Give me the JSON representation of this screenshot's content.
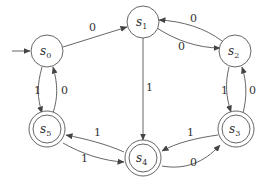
{
  "diagram": {
    "type": "finite-state-automaton",
    "start_state": "s0",
    "states": [
      {
        "id": "s0",
        "label": "s",
        "sub": "0",
        "accepting": false,
        "x": 47,
        "y": 51
      },
      {
        "id": "s1",
        "label": "s",
        "sub": "1",
        "accepting": false,
        "x": 143,
        "y": 22
      },
      {
        "id": "s2",
        "label": "s",
        "sub": "2",
        "accepting": false,
        "x": 235,
        "y": 51
      },
      {
        "id": "s3",
        "label": "s",
        "sub": "3",
        "accepting": true,
        "x": 236,
        "y": 129
      },
      {
        "id": "s4",
        "label": "s",
        "sub": "4",
        "accepting": true,
        "x": 143,
        "y": 158
      },
      {
        "id": "s5",
        "label": "s",
        "sub": "5",
        "accepting": true,
        "x": 47,
        "y": 129
      }
    ],
    "transitions": [
      {
        "from": "s0",
        "to": "s1",
        "label": "0"
      },
      {
        "from": "s0",
        "to": "s5",
        "label": "1"
      },
      {
        "from": "s5",
        "to": "s0",
        "label": "0"
      },
      {
        "from": "s1",
        "to": "s2",
        "label": "0"
      },
      {
        "from": "s2",
        "to": "s1",
        "label": "0"
      },
      {
        "from": "s1",
        "to": "s4",
        "label": "1"
      },
      {
        "from": "s2",
        "to": "s3",
        "label": "1"
      },
      {
        "from": "s3",
        "to": "s2",
        "label": "0"
      },
      {
        "from": "s3",
        "to": "s4",
        "label": "1"
      },
      {
        "from": "s4",
        "to": "s3",
        "label": "0"
      },
      {
        "from": "s4",
        "to": "s5",
        "label": "1"
      },
      {
        "from": "s5",
        "to": "s4",
        "label": "1"
      }
    ]
  }
}
